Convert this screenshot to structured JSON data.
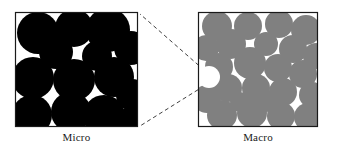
{
  "figure": {
    "type": "diagram",
    "colors": {
      "background": "#ffffff",
      "frame_stroke": "#1a1a1a",
      "micro_particle": "#000000",
      "macro_particle": "#808080",
      "void_fill": "#ffffff",
      "callout_line": "#2a2a2a",
      "label_text": "#1a1a1a"
    },
    "panels": [
      {
        "id": "micro",
        "label": "Micro",
        "frame": {
          "x": 15,
          "y": 12,
          "w": 123,
          "h": 115
        },
        "particle_color": "#000000",
        "particle_count": 14,
        "particles": [
          {
            "cx": 38,
            "cy": 33,
            "r": 21
          },
          {
            "cx": 74,
            "cy": 28,
            "r": 19
          },
          {
            "cx": 108,
            "cy": 30,
            "r": 22
          },
          {
            "cx": 131,
            "cy": 48,
            "r": 17
          },
          {
            "cx": 56,
            "cy": 52,
            "r": 17
          },
          {
            "cx": 97,
            "cy": 56,
            "r": 15
          },
          {
            "cx": 33,
            "cy": 78,
            "r": 21
          },
          {
            "cx": 74,
            "cy": 80,
            "r": 21
          },
          {
            "cx": 114,
            "cy": 77,
            "r": 20
          },
          {
            "cx": 132,
            "cy": 95,
            "r": 16
          },
          {
            "cx": 32,
            "cy": 115,
            "r": 20
          },
          {
            "cx": 71,
            "cy": 112,
            "r": 20
          },
          {
            "cx": 104,
            "cy": 116,
            "r": 21
          },
          {
            "cx": 131,
            "cy": 122,
            "r": 15
          }
        ]
      },
      {
        "id": "macro",
        "label": "Macro",
        "frame": {
          "x": 198,
          "y": 12,
          "w": 120,
          "h": 115
        },
        "particle_color": "#808080",
        "particle_count": 24,
        "particles": [
          {
            "cx": 217,
            "cy": 26,
            "r": 15
          },
          {
            "cx": 248,
            "cy": 26,
            "r": 14
          },
          {
            "cx": 279,
            "cy": 24,
            "r": 14
          },
          {
            "cx": 306,
            "cy": 30,
            "r": 15
          },
          {
            "cx": 206,
            "cy": 48,
            "r": 13
          },
          {
            "cx": 231,
            "cy": 44,
            "r": 15
          },
          {
            "cx": 266,
            "cy": 44,
            "r": 12
          },
          {
            "cx": 293,
            "cy": 49,
            "r": 14
          },
          {
            "cx": 316,
            "cy": 56,
            "r": 13
          },
          {
            "cx": 219,
            "cy": 67,
            "r": 14
          },
          {
            "cx": 250,
            "cy": 63,
            "r": 16
          },
          {
            "cx": 278,
            "cy": 68,
            "r": 14
          },
          {
            "cx": 303,
            "cy": 74,
            "r": 14
          },
          {
            "cx": 228,
            "cy": 88,
            "r": 14
          },
          {
            "cx": 256,
            "cy": 88,
            "r": 14
          },
          {
            "cx": 283,
            "cy": 92,
            "r": 14
          },
          {
            "cx": 312,
            "cy": 95,
            "r": 13
          },
          {
            "cx": 207,
            "cy": 99,
            "r": 14
          },
          {
            "cx": 222,
            "cy": 115,
            "r": 15
          },
          {
            "cx": 252,
            "cy": 113,
            "r": 15
          },
          {
            "cx": 281,
            "cy": 116,
            "r": 14
          },
          {
            "cx": 308,
            "cy": 117,
            "r": 14
          },
          {
            "cx": 266,
            "cy": 101,
            "r": 11
          },
          {
            "cx": 240,
            "cy": 102,
            "r": 10
          }
        ],
        "voids": [
          {
            "cx": 209,
            "cy": 77,
            "r": 11,
            "note": "white pore circle that is the zoom source"
          }
        ]
      }
    ],
    "callouts": [
      {
        "from": [
          204,
          70
        ],
        "to": [
          140,
          14
        ],
        "style": "dashed"
      },
      {
        "from": [
          204,
          86
        ],
        "to": [
          140,
          126
        ],
        "style": "dashed"
      }
    ]
  }
}
